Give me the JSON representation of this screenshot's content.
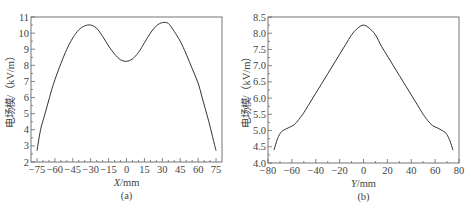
{
  "chart_data": [
    {
      "id": "a",
      "type": "line",
      "title": "",
      "caption": "(a)",
      "xlabel": "X/mm",
      "xlabel_italic_part": "X",
      "xlabel_unit_part": "/mm",
      "ylabel": "电场模/（kV/m）",
      "xlim": [
        -80,
        80
      ],
      "ylim": [
        2,
        11
      ],
      "xticks": [
        -75,
        -60,
        -45,
        -30,
        -15,
        0,
        15,
        30,
        45,
        60,
        75
      ],
      "xtick_labels": [
        "−75",
        "−60",
        "−45",
        "−30",
        "−15",
        "0",
        "15",
        "30",
        "45",
        "60",
        "75"
      ],
      "yticks": [
        2,
        3,
        4,
        5,
        6,
        7,
        8,
        9,
        10,
        11
      ],
      "ytick_labels": [
        "2",
        "3",
        "4",
        "5",
        "6",
        "7",
        "8",
        "9",
        "10",
        "11"
      ],
      "grid": false,
      "legend": null,
      "series": [
        {
          "name": "electric field magnitude",
          "x": [
            -75,
            -72,
            -69,
            -66,
            -63,
            -60,
            -55,
            -50,
            -45,
            -40,
            -35,
            -30,
            -25,
            -20,
            -15,
            -10,
            -5,
            0,
            5,
            10,
            15,
            20,
            25,
            30,
            35,
            40,
            45,
            50,
            55,
            60,
            63,
            66,
            69,
            72,
            75
          ],
          "y": [
            2.7,
            4.0,
            4.8,
            5.6,
            6.4,
            7.1,
            8.1,
            9.0,
            9.7,
            10.2,
            10.45,
            10.5,
            10.3,
            9.8,
            9.2,
            8.7,
            8.35,
            8.25,
            8.4,
            8.8,
            9.4,
            10.0,
            10.45,
            10.65,
            10.6,
            10.1,
            9.5,
            8.7,
            7.8,
            6.9,
            6.1,
            5.3,
            4.5,
            3.6,
            2.7
          ]
        }
      ]
    },
    {
      "id": "b",
      "type": "line",
      "title": "",
      "caption": "(b)",
      "xlabel": "Y/mm",
      "xlabel_italic_part": "Y",
      "xlabel_unit_part": "/mm",
      "ylabel": "电场模/（kV/m）",
      "xlim": [
        -80,
        80
      ],
      "ylim": [
        4.0,
        8.5
      ],
      "xticks": [
        -80,
        -60,
        -40,
        -20,
        0,
        20,
        40,
        60,
        80
      ],
      "xtick_labels": [
        "−80",
        "−60",
        "−40",
        "−20",
        "0",
        "20",
        "40",
        "60",
        "80"
      ],
      "yticks": [
        4.0,
        4.5,
        5.0,
        5.5,
        6.0,
        6.5,
        7.0,
        7.5,
        8.0,
        8.5
      ],
      "ytick_labels": [
        "4.0",
        "4.5",
        "5.0",
        "5.5",
        "6.0",
        "6.5",
        "7.0",
        "7.5",
        "8.0",
        "8.5"
      ],
      "grid": false,
      "legend": null,
      "series": [
        {
          "name": "electric field magnitude",
          "x": [
            -75,
            -72,
            -69,
            -66,
            -62,
            -58,
            -54,
            -50,
            -45,
            -40,
            -35,
            -30,
            -25,
            -20,
            -15,
            -10,
            -5,
            0,
            5,
            10,
            15,
            20,
            25,
            30,
            35,
            40,
            45,
            50,
            54,
            58,
            62,
            66,
            69,
            72,
            75
          ],
          "y": [
            4.4,
            4.75,
            4.95,
            5.03,
            5.1,
            5.18,
            5.35,
            5.55,
            5.85,
            6.15,
            6.45,
            6.75,
            7.05,
            7.35,
            7.65,
            7.95,
            8.15,
            8.25,
            8.15,
            7.95,
            7.6,
            7.3,
            7.0,
            6.7,
            6.4,
            6.1,
            5.8,
            5.5,
            5.3,
            5.15,
            5.08,
            5.0,
            4.92,
            4.72,
            4.4
          ]
        }
      ]
    }
  ]
}
